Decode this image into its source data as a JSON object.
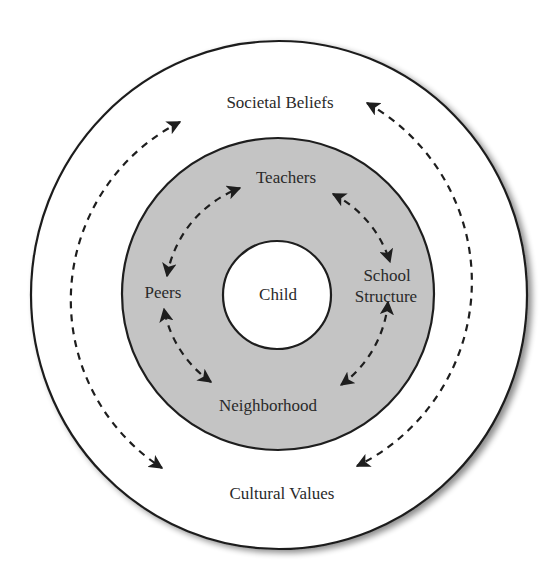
{
  "diagram": {
    "type": "concentric-ecological-model",
    "colors": {
      "background": "#ffffff",
      "outer_ring_fill": "#ffffff",
      "middle_ring_fill": "#c4c4c4",
      "center_fill": "#ffffff",
      "stroke": "#1e1e1e",
      "text": "#2a2a2a"
    },
    "center": {
      "label": "Child"
    },
    "middle_ring": {
      "nodes": {
        "teachers": "Teachers",
        "school_structure_line1": "School",
        "school_structure_line2": "Structure",
        "neighborhood": "Neighborhood",
        "peers": "Peers"
      },
      "connections": [
        {
          "from": "Peers",
          "to": "Teachers",
          "style": "dashed",
          "bidirectional": true
        },
        {
          "from": "Teachers",
          "to": "School Structure",
          "style": "dashed",
          "bidirectional": true
        },
        {
          "from": "School Structure",
          "to": "Neighborhood",
          "style": "dashed",
          "bidirectional": true
        },
        {
          "from": "Neighborhood",
          "to": "Peers",
          "style": "dashed",
          "bidirectional": true
        }
      ]
    },
    "outer_ring": {
      "nodes": {
        "societal_beliefs": "Societal Beliefs",
        "cultural_values": "Cultural Values"
      },
      "connections": [
        {
          "from": "Societal Beliefs",
          "to": "Cultural Values",
          "path": "left-arc",
          "style": "dashed",
          "bidirectional": true
        },
        {
          "from": "Societal Beliefs",
          "to": "Cultural Values",
          "path": "right-arc",
          "style": "dashed",
          "bidirectional": true
        }
      ]
    }
  }
}
